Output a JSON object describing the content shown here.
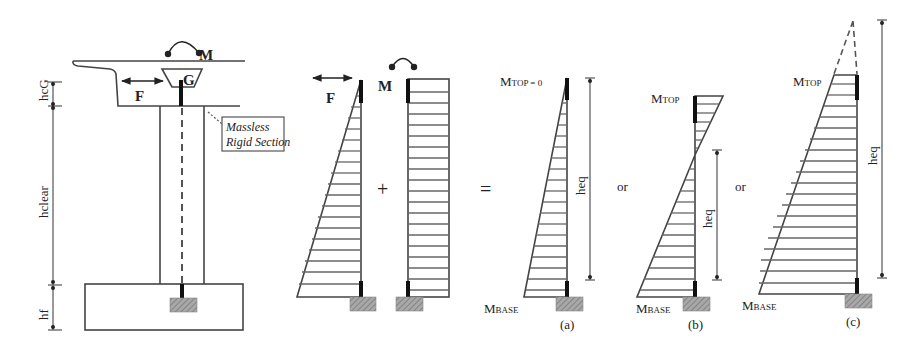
{
  "figure": {
    "pier": {
      "moment_label": "M",
      "force_label": "F",
      "centroid_label": "G",
      "note_box": {
        "line1": "Massless",
        "line2": "Rigid Section"
      },
      "dimensions": {
        "top": "hcG",
        "clear": "hclear",
        "footing": "hf"
      }
    },
    "components": {
      "force_label": "F",
      "moment_label": "M",
      "plus_sign": "+",
      "equals_sign": "="
    },
    "cases": [
      {
        "id": "a",
        "caption": "(a)",
        "top_label": "MTOP = 0",
        "top_label_main": "M",
        "top_label_sub": "TOP = 0",
        "base_label_main": "M",
        "base_label_sub": "BASE",
        "height_label": "heq"
      },
      {
        "id": "b",
        "caption": "(b)",
        "separator": "or",
        "top_label_main": "M",
        "top_label_sub": "TOP",
        "base_label_main": "M",
        "base_label_sub": "BASE",
        "height_label": "heq"
      },
      {
        "id": "c",
        "caption": "(c)",
        "separator": "or",
        "top_label_main": "M",
        "top_label_sub": "TOP",
        "base_label_main": "M",
        "base_label_sub": "BASE",
        "height_label": "heq"
      }
    ],
    "colors": {
      "line": "#444444",
      "hatch_fill": "#9a9a9a",
      "background": "#ffffff"
    }
  }
}
